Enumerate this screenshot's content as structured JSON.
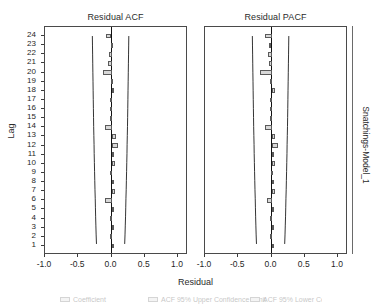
{
  "chart_data": {
    "type": "bar",
    "orientation": "horizontal",
    "xlabel": "Residual",
    "ylabel": "Lag",
    "strip_label": "Snatchings-Model_1",
    "xlim": [
      -1.0,
      1.15
    ],
    "xticks": [
      -1.0,
      -0.5,
      0.0,
      0.5,
      1.0
    ],
    "xtick_labels": [
      "-1.0",
      "-0.5",
      "0.0",
      "0.5",
      "1.0"
    ],
    "grid": false,
    "legend_position": "bottom",
    "categories": [
      1,
      2,
      3,
      4,
      5,
      6,
      7,
      8,
      9,
      10,
      11,
      12,
      13,
      14,
      15,
      16,
      17,
      18,
      19,
      20,
      21,
      22,
      23,
      24
    ],
    "panels": [
      {
        "name": "acf",
        "title": "Residual ACF",
        "series_name": "ACF",
        "values": [
          0.005,
          -0.02,
          0.005,
          -0.03,
          0.005,
          -0.1,
          0.055,
          0.01,
          -0.02,
          0.055,
          0.01,
          0.105,
          0.065,
          -0.1,
          -0.02,
          -0.02,
          -0.025,
          0.035,
          -0.015,
          -0.125,
          -0.06,
          -0.045,
          -0.015,
          -0.085
        ],
        "confidence_upper": [
          0.215,
          0.22,
          0.224,
          0.228,
          0.231,
          0.234,
          0.238,
          0.241,
          0.244,
          0.247,
          0.25,
          0.252,
          0.255,
          0.258,
          0.26,
          0.262,
          0.264,
          0.266,
          0.268,
          0.27,
          0.272,
          0.274,
          0.276,
          0.278
        ],
        "confidence_lower": [
          -0.215,
          -0.22,
          -0.224,
          -0.228,
          -0.231,
          -0.234,
          -0.238,
          -0.241,
          -0.244,
          -0.247,
          -0.25,
          -0.252,
          -0.255,
          -0.258,
          -0.26,
          -0.262,
          -0.264,
          -0.266,
          -0.268,
          -0.27,
          -0.272,
          -0.274,
          -0.276,
          -0.278
        ]
      },
      {
        "name": "pacf",
        "title": "Residual PACF",
        "series_name": "PACF",
        "values": [
          0.005,
          -0.02,
          0.005,
          -0.03,
          0.01,
          -0.075,
          0.055,
          0.005,
          -0.015,
          0.06,
          0.025,
          0.105,
          0.055,
          -0.095,
          -0.02,
          -0.02,
          -0.03,
          0.06,
          -0.02,
          -0.17,
          -0.045,
          -0.06,
          -0.035,
          -0.095
        ],
        "confidence_upper": [
          0.215,
          0.22,
          0.224,
          0.228,
          0.231,
          0.234,
          0.238,
          0.241,
          0.244,
          0.247,
          0.25,
          0.252,
          0.255,
          0.258,
          0.26,
          0.262,
          0.264,
          0.266,
          0.268,
          0.27,
          0.272,
          0.274,
          0.276,
          0.278
        ],
        "confidence_lower": [
          -0.215,
          -0.22,
          -0.224,
          -0.228,
          -0.231,
          -0.234,
          -0.238,
          -0.241,
          -0.244,
          -0.247,
          -0.25,
          -0.252,
          -0.255,
          -0.258,
          -0.26,
          -0.262,
          -0.264,
          -0.266,
          -0.268,
          -0.27,
          -0.272,
          -0.274,
          -0.276,
          -0.278
        ]
      }
    ],
    "legend": [
      {
        "label": "Coefficient"
      },
      {
        "label": "ACF 95% Upper Confidence Limit"
      },
      {
        "label": "ACF 95% Lower Confidence Limit"
      }
    ]
  }
}
